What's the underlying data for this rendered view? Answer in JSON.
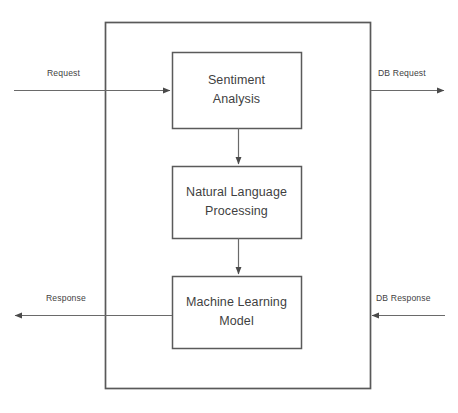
{
  "diagram": {
    "type": "block-diagram",
    "background_color": "#ffffff",
    "line_color": "#595959",
    "text_color": "#3f3f3f",
    "container": {
      "name": "system-boundary",
      "label": "",
      "x": 105,
      "y": 22,
      "width": 265,
      "height": 366
    },
    "boxes": [
      {
        "id": "sentiment-analysis",
        "line1": "Sentiment",
        "line2": "Analysis",
        "x": 172,
        "y": 52,
        "width": 129,
        "height": 76
      },
      {
        "id": "natural-language-processing",
        "line1": "Natural Language",
        "line2": "Processing",
        "x": 172,
        "y": 166,
        "width": 129,
        "height": 72
      },
      {
        "id": "machine-learning-model",
        "line1": "Machine Learning",
        "line2": "Model",
        "x": 172,
        "y": 276,
        "width": 129,
        "height": 72
      }
    ],
    "edge_labels": [
      {
        "id": "request",
        "text": "Request",
        "x": 47,
        "y": 68
      },
      {
        "id": "db-request",
        "text": "DB Request",
        "x": 378,
        "y": 68
      },
      {
        "id": "response",
        "text": "Response",
        "x": 46,
        "y": 293
      },
      {
        "id": "db-response",
        "text": "DB Response",
        "x": 376,
        "y": 293
      }
    ],
    "connectors": [
      {
        "id": "request-arrow",
        "direction": "right",
        "from_x": 14,
        "to_x": 172,
        "y": 90
      },
      {
        "id": "db-request-arrow",
        "direction": "right",
        "from_x": 370,
        "to_x": 444,
        "y": 90
      },
      {
        "id": "response-arrow",
        "direction": "left",
        "from_x": 172,
        "to_x": 14,
        "y": 315
      },
      {
        "id": "db-response-arrow",
        "direction": "left",
        "from_x": 445,
        "to_x": 371,
        "y": 315
      },
      {
        "id": "sentiment-to-nlp-arrow",
        "direction": "down",
        "x": 238,
        "from_y": 128,
        "to_y": 166
      },
      {
        "id": "nlp-to-ml-arrow",
        "direction": "down",
        "x": 238,
        "from_y": 238,
        "to_y": 276
      }
    ]
  }
}
